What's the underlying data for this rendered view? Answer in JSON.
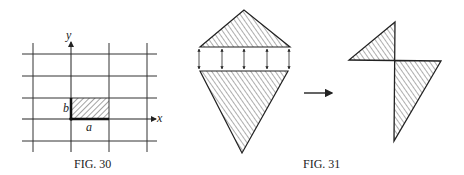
{
  "figures": [
    {
      "id": "fig30",
      "caption": "FIG. 30",
      "axis_labels": {
        "x": "x",
        "y": "y"
      },
      "rect_labels": {
        "width": "a",
        "height": "b"
      }
    },
    {
      "id": "fig31",
      "caption": "FIG. 31"
    }
  ],
  "colors": {
    "ink": "#222222",
    "background": "#ffffff"
  }
}
